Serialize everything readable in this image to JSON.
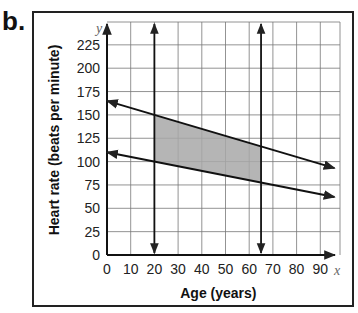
{
  "panel_label": "b.",
  "chart_data": {
    "type": "line",
    "title": "",
    "xlabel": "Age (years)",
    "ylabel": "Heart rate (beats per minute)",
    "x_axis_var": "x",
    "y_axis_var": "y",
    "xlim": [
      0,
      100
    ],
    "ylim": [
      0,
      250
    ],
    "x_ticks": [
      0,
      10,
      20,
      30,
      40,
      50,
      60,
      70,
      80,
      90
    ],
    "y_ticks": [
      0,
      25,
      50,
      75,
      100,
      125,
      150,
      175,
      200,
      225
    ],
    "grid": true,
    "series": [
      {
        "name": "upper boundary",
        "equation": "y = -0.75x + 165",
        "points": [
          [
            0,
            165
          ],
          [
            100,
            90
          ]
        ]
      },
      {
        "name": "lower boundary",
        "equation": "y = -0.5x + 110",
        "points": [
          [
            0,
            110
          ],
          [
            100,
            60
          ]
        ]
      },
      {
        "name": "x = 20",
        "points": [
          [
            20,
            0
          ],
          [
            20,
            250
          ]
        ]
      },
      {
        "name": "x = 65",
        "points": [
          [
            65,
            0
          ],
          [
            65,
            250
          ]
        ]
      }
    ],
    "shaded_region": {
      "description": "feasible region bounded by x=20, x=65 and the two lines",
      "vertices": [
        [
          20,
          150
        ],
        [
          65,
          116.25
        ],
        [
          65,
          77.5
        ],
        [
          20,
          100
        ]
      ],
      "color": "#a8a8a8"
    }
  },
  "tick_labels": {
    "x": [
      "0",
      "10",
      "20",
      "30",
      "40",
      "50",
      "60",
      "70",
      "80",
      "90"
    ],
    "y": [
      "0",
      "25",
      "50",
      "75",
      "100",
      "125",
      "150",
      "175",
      "200",
      "225"
    ]
  },
  "axis_vars": {
    "x": "x",
    "y": "y"
  },
  "labels": {
    "xlabel": "Age (years)",
    "ylabel": "Heart rate (beats per minute)"
  }
}
